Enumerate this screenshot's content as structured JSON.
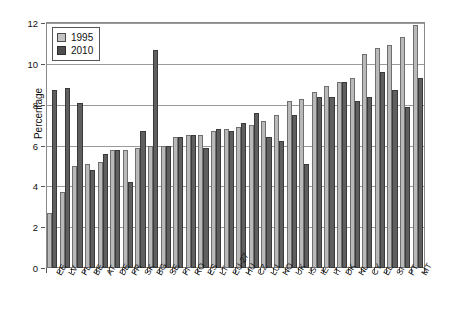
{
  "chart_data": {
    "type": "bar",
    "title": "",
    "subtitle": "",
    "xlabel": "",
    "ylabel": "Percentage",
    "ylim": [
      0,
      12
    ],
    "yticks": [
      0,
      2,
      4,
      6,
      8,
      10,
      12
    ],
    "grid": true,
    "legend_position": "top-left",
    "categories": [
      "EE",
      "LV",
      "PL",
      "BE",
      "AT",
      "DE",
      "FR",
      "SK",
      "BG",
      "SE",
      "FI",
      "RO",
      "ES",
      "LT",
      "EU-27",
      "HU",
      "CZ",
      "LU",
      "NO",
      "UK",
      "IS",
      "IE",
      "IT",
      "DK",
      "NL",
      "CY",
      "EL",
      "SI",
      "PT",
      "MT"
    ],
    "series": [
      {
        "name": "1995",
        "color": "#b9b9b9",
        "values": [
          2.7,
          3.7,
          5.0,
          5.1,
          5.2,
          5.8,
          5.8,
          5.9,
          6.0,
          6.0,
          6.4,
          6.5,
          6.5,
          6.7,
          6.8,
          6.9,
          7.0,
          7.2,
          7.5,
          8.2,
          8.3,
          8.6,
          8.9,
          9.1,
          9.3,
          10.5,
          10.8,
          10.9,
          11.3,
          11.9
        ]
      },
      {
        "name": "2010",
        "color": "#5f5f5f",
        "values": [
          8.7,
          8.8,
          8.1,
          4.8,
          5.6,
          5.8,
          4.2,
          6.7,
          10.7,
          6.0,
          6.4,
          6.5,
          5.9,
          6.8,
          6.7,
          7.1,
          7.6,
          6.4,
          6.2,
          7.5,
          5.1,
          8.4,
          8.4,
          9.1,
          8.2,
          8.4,
          9.6,
          8.7,
          7.9,
          9.3
        ]
      }
    ]
  },
  "legend": {
    "items": [
      {
        "label": "1995",
        "swatch": "light-gray-swatch"
      },
      {
        "label": "2010",
        "swatch": "dark-gray-swatch"
      }
    ]
  }
}
